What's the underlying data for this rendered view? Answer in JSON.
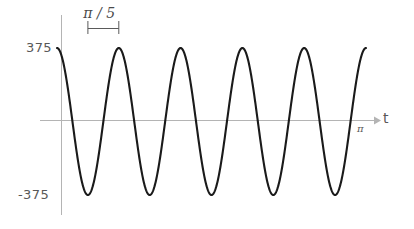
{
  "chart_data": {
    "type": "line",
    "title": "",
    "subtitle": "",
    "xlabel": "t",
    "ylabel": "",
    "grid": false,
    "legend": null,
    "xlim": [
      0,
      3.14159
    ],
    "ylim": [
      -470,
      470
    ],
    "x_tick_labels": [
      "π"
    ],
    "x_tick_values": [
      3.14159
    ],
    "y_tick_labels": [
      "375",
      "-375"
    ],
    "y_tick_values": [
      375,
      -375
    ],
    "annotations": [
      {
        "name": "period-bracket",
        "text": "π / 5",
        "x_start": 0.31416,
        "x_end": 0.62832,
        "meaning": "one period of the waveform"
      }
    ],
    "series": [
      {
        "name": "waveform",
        "color": "#1a1a1a",
        "amplitude": 375,
        "period": 0.62832,
        "angular_frequency": 10,
        "phase_deg": 90,
        "equation": "375 cos(10 t)",
        "x": [
          0.0,
          0.0314,
          0.0628,
          0.0942,
          0.1257,
          0.1571,
          0.1885,
          0.2199,
          0.2513,
          0.2827,
          0.3142,
          0.3456,
          0.377,
          0.4084,
          0.4398,
          0.4712,
          0.5027,
          0.5341,
          0.5655,
          0.5969,
          0.6283,
          0.6597,
          0.6912,
          0.7226,
          0.754,
          0.7854,
          0.8168,
          0.8482,
          0.8796,
          0.911,
          0.9425,
          0.9739,
          1.0053,
          1.0367,
          1.0681,
          1.0996,
          1.131,
          1.1624,
          1.1938,
          1.2252,
          1.2566,
          1.288,
          1.3195,
          1.3509,
          1.3823,
          1.4137,
          1.4451,
          1.4765,
          1.508,
          1.5394,
          1.5708,
          1.6022,
          1.6336,
          1.665,
          1.6965,
          1.7279,
          1.7593,
          1.7907,
          1.8221,
          1.8535,
          1.885,
          1.9164,
          1.9478,
          1.9792,
          2.0106,
          2.042,
          2.0735,
          2.1049,
          2.1363,
          2.1677,
          2.1991,
          2.2305,
          2.2619,
          2.2934,
          2.3248,
          2.3562,
          2.3876,
          2.419,
          2.4504,
          2.4819,
          2.5133,
          2.5447,
          2.5761,
          2.6075,
          2.6389,
          2.6704,
          2.7018,
          2.7332,
          2.7646,
          2.796,
          2.8274,
          2.8588,
          2.8903,
          2.9217,
          2.9531,
          2.9845,
          3.0159,
          3.0473,
          3.0788,
          3.1102,
          3.1416
        ],
        "y": [
          375,
          356,
          303,
          220,
          116,
          0,
          -116,
          -220,
          -303,
          -356,
          -375,
          -356,
          -303,
          -220,
          -116,
          0,
          116,
          220,
          303,
          356,
          375,
          356,
          303,
          220,
          116,
          0,
          -116,
          -220,
          -303,
          -356,
          -375,
          -356,
          -303,
          -220,
          -116,
          0,
          116,
          220,
          303,
          356,
          375,
          356,
          303,
          220,
          116,
          0,
          -116,
          -220,
          -303,
          -356,
          -375,
          -356,
          -303,
          -220,
          -116,
          0,
          116,
          220,
          303,
          356,
          375,
          356,
          303,
          220,
          116,
          0,
          -116,
          -220,
          -303,
          -356,
          -375,
          -356,
          -303,
          -220,
          -116,
          0,
          116,
          220,
          303,
          356,
          375,
          356,
          303,
          220,
          116,
          0,
          -116,
          -220,
          -303,
          -356,
          -375,
          -356,
          -303,
          -220,
          -116,
          0,
          116,
          220,
          303,
          356,
          375
        ]
      }
    ]
  },
  "axes": {
    "y_axis_name": "vertical-axis",
    "x_axis_name": "horizontal-axis",
    "axis_color": "#b4b4b4",
    "curve_color": "#1a1a1a"
  },
  "labels": {
    "y_max": "375",
    "y_min": "-375",
    "x_axis": "t",
    "x_tick_pi": "π",
    "period": "π / 5"
  }
}
